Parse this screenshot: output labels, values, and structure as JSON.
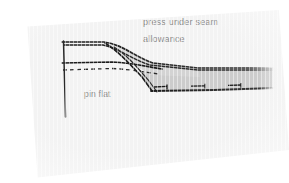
{
  "image": {
    "kind": "scanned-sewing-instruction-diagram",
    "subject": "folded fabric cross-section with pressed seam allowance"
  },
  "canvas": {
    "width": 289,
    "height": 183
  },
  "colors": {
    "paper": "#f3f3f3",
    "page_background": "#ffffff",
    "ink": "#1c1c1c",
    "fabric_fill": "#c9c9c9",
    "fabric_fill_light": "#d9d9d9",
    "label_text": "#8b8b8b",
    "dashed_line": "#2b2b2b"
  },
  "labels": {
    "press_under_seam": "press under seam",
    "allowance": "allowance",
    "pin_flat": "pin flat"
  },
  "diagram": {
    "upper_fabric_edge": "M 62,42 L 104,42 C 122,44 134,56 152,62 L 196,67 L 272,68",
    "upper_fabric_under": "M 62,44 L 103,44 C 120,47 131,58 150,64 L 196,69 L 272,70",
    "fold_diagonal_front": "M 104,43 C 118,50 128,62 142,76 L 152,90",
    "fold_diagonal_back": "M 113,46 C 126,54 136,66 148,80 L 156,92",
    "mid_solid_line": "M 62,63 L 112,62 C 130,63 142,66 160,68",
    "dashed_line": "M 63,70 L 112,68 C 130,69 142,71 158,73",
    "vertical_pin_line": "M 63,42 L 65,118",
    "lower_fabric_edge": "M 152,91 L 214,90 L 272,88",
    "allowance_band": "M 152,62 L 196,67 L 272,68 L 272,88 L 214,90 L 152,91 L 140,76 Z",
    "allowance_band_upper": "M 104,43 C 122,45 134,57 152,63 L 196,68 L 200,76 L 150,74 L 128,60 Z",
    "shadow_tail": "M 262,68 L 275,68 L 275,88 L 262,88 Z"
  },
  "pins": [
    {
      "id": "pin-1",
      "x": 160,
      "y": 87,
      "width": 13
    },
    {
      "id": "pin-2",
      "x": 196,
      "y": 86,
      "width": 14
    },
    {
      "id": "pin-3",
      "x": 233,
      "y": 85,
      "width": 13
    }
  ]
}
